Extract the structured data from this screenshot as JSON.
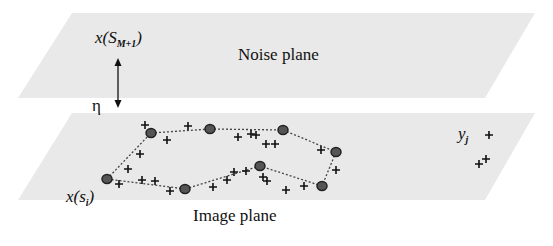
{
  "diagram": {
    "noise_plane": {
      "label": "Noise plane",
      "fill": "#e9e9e9",
      "polygon": [
        [
          72,
          13
        ],
        [
          535,
          13
        ],
        [
          485,
          98
        ],
        [
          18,
          98
        ]
      ]
    },
    "image_plane": {
      "label": "Image plane",
      "fill": "#e9e9e9",
      "polygon": [
        [
          72,
          113
        ],
        [
          535,
          113
        ],
        [
          485,
          200
        ],
        [
          18,
          200
        ]
      ]
    },
    "arrow": {
      "label": "η",
      "x": 118,
      "y_top": 58,
      "y_bottom": 108
    },
    "labels": {
      "outlier_node_base": "x(S",
      "outlier_node_sub": "M+1",
      "outlier_node_close": ")",
      "contour_node_base": "x(s",
      "contour_node_sub": "i",
      "contour_node_close": ")",
      "feature_base": "y",
      "feature_sub": "j"
    },
    "contour_nodes": [
      [
        107,
        179
      ],
      [
        151,
        133
      ],
      [
        210,
        129
      ],
      [
        283,
        130
      ],
      [
        336,
        152
      ],
      [
        322,
        186
      ],
      [
        260,
        166
      ],
      [
        185,
        189
      ]
    ],
    "contour_edges": [
      [
        0,
        1
      ],
      [
        1,
        2
      ],
      [
        2,
        3
      ],
      [
        3,
        4
      ],
      [
        4,
        5
      ],
      [
        5,
        6
      ],
      [
        6,
        7
      ],
      [
        7,
        0
      ]
    ],
    "feature_points": [
      [
        145,
        125
      ],
      [
        188,
        126
      ],
      [
        167,
        140
      ],
      [
        140,
        154
      ],
      [
        128,
        169
      ],
      [
        119,
        184
      ],
      [
        142,
        180
      ],
      [
        155,
        181
      ],
      [
        170,
        191
      ],
      [
        213,
        187
      ],
      [
        227,
        180
      ],
      [
        234,
        172
      ],
      [
        246,
        171
      ],
      [
        263,
        177
      ],
      [
        238,
        137
      ],
      [
        251,
        134
      ],
      [
        256,
        135
      ],
      [
        266,
        144
      ],
      [
        275,
        144
      ],
      [
        267,
        181
      ],
      [
        286,
        190
      ],
      [
        304,
        186
      ],
      [
        321,
        150
      ],
      [
        336,
        170
      ],
      [
        489,
        135
      ],
      [
        486,
        159
      ],
      [
        479,
        164
      ]
    ],
    "colors": {
      "node_fill": "#555555",
      "node_stroke": "#222222",
      "edge": "#444444",
      "plus": "#111111",
      "arrow": "#111111"
    }
  }
}
